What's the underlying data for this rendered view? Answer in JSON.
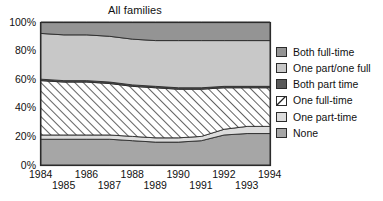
{
  "chart_data": {
    "type": "area",
    "title": "All families",
    "xlabel": "",
    "ylabel": "",
    "ylim": [
      0,
      100
    ],
    "ytick_labels": [
      "0%",
      "20%",
      "40%",
      "60%",
      "80%",
      "100%"
    ],
    "ytick_values": [
      0,
      20,
      40,
      60,
      80,
      100
    ],
    "grid": false,
    "legend_position": "right",
    "stacked": true,
    "stack_order_bottom_to_top": [
      "None",
      "One part-time",
      "One full-time",
      "Both part time",
      "One part/one full",
      "Both full-time"
    ],
    "x": [
      1984,
      1985,
      1986,
      1987,
      1988,
      1989,
      1990,
      1991,
      1992,
      1993,
      1994
    ],
    "xtick_labels": [
      "1984",
      "1985",
      "1986",
      "1987",
      "1988",
      "1989",
      "1990",
      "1991",
      "1992",
      "1993",
      "1994"
    ],
    "series": [
      {
        "name": "None",
        "color": "#a6a6a6",
        "hatch": "none",
        "values": [
          18,
          18,
          18,
          18,
          17,
          16,
          16,
          17,
          21,
          22,
          22
        ]
      },
      {
        "name": "One part-time",
        "color": "#dcdcdc",
        "hatch": "none",
        "values": [
          3,
          3,
          3,
          3,
          3,
          3,
          3,
          3,
          4,
          5,
          5
        ]
      },
      {
        "name": "One full-time",
        "color": "#ffffff",
        "hatch": "diagonal",
        "values": [
          38,
          37,
          37,
          36,
          35,
          35,
          34,
          33,
          29,
          27,
          27
        ]
      },
      {
        "name": "Both part time",
        "color": "#595959",
        "hatch": "none",
        "values": [
          1,
          1,
          1,
          1,
          1,
          1,
          1,
          1,
          1,
          1,
          1
        ]
      },
      {
        "name": "One part/one full",
        "color": "#c8c8c8",
        "hatch": "none",
        "values": [
          32,
          32,
          32,
          32,
          32,
          32,
          33,
          33,
          32,
          32,
          32
        ]
      },
      {
        "name": "Both full-time",
        "color": "#949494",
        "hatch": "none",
        "values": [
          8,
          9,
          9,
          10,
          12,
          13,
          13,
          13,
          13,
          13,
          13
        ]
      }
    ]
  },
  "legend": {
    "items": [
      {
        "label": "Both full-time",
        "color": "#949494",
        "hatch": "none"
      },
      {
        "label": "One part/one full",
        "color": "#c8c8c8",
        "hatch": "none"
      },
      {
        "label": "Both part time",
        "color": "#595959",
        "hatch": "none"
      },
      {
        "label": "One full-time",
        "color": "#ffffff",
        "hatch": "diagonal"
      },
      {
        "label": "One part-time",
        "color": "#dcdcdc",
        "hatch": "none"
      },
      {
        "label": "None",
        "color": "#a6a6a6",
        "hatch": "none"
      }
    ]
  }
}
